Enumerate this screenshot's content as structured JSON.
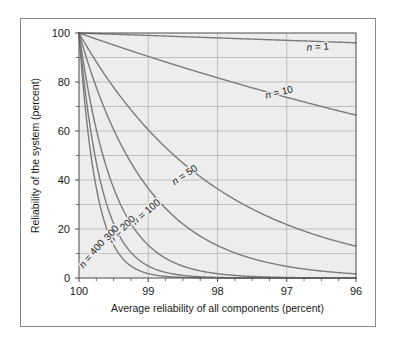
{
  "figure": {
    "background_color": "#ffffff",
    "frame_color": "#8a8a8a",
    "plot_background_color": "#ededed",
    "grid_color": "#b4b4b4",
    "axis_color": "#4a4a4a",
    "curve_color": "#7b7b7b"
  },
  "chart_data": {
    "type": "line",
    "title": "",
    "subtitle": "",
    "xlabel": "Average reliability of all components (percent)",
    "ylabel": "Reliability of the system (percent)",
    "xlim": [
      100,
      96
    ],
    "ylim": [
      0,
      100
    ],
    "x_ticks": [
      100,
      99,
      98,
      97,
      96
    ],
    "x_tick_labels": [
      "100",
      "99",
      "98",
      "97",
      "96"
    ],
    "x_minor_ticks": [
      99.75,
      99.5,
      99.25,
      98.75,
      98.5,
      98.25,
      97.75,
      97.5,
      97.25,
      96.75,
      96.5,
      96.25
    ],
    "y_ticks": [
      0,
      20,
      40,
      60,
      80,
      100
    ],
    "y_tick_labels": [
      "0",
      "20",
      "40",
      "60",
      "80",
      "100"
    ],
    "y_minor_ticks": [
      10,
      30,
      50,
      70,
      90
    ],
    "grid": true,
    "grid_x_values": [
      99,
      98,
      97
    ],
    "grid_y_values": [
      10,
      20,
      30,
      40,
      50,
      60,
      70,
      80,
      90
    ],
    "legend_position": "inline-curve-labels",
    "annotations": [
      "n = 1",
      "n = 10",
      "n = 50",
      "n = 100",
      "n = 200",
      "n = 300",
      "n = 400"
    ],
    "formula": "R = r^n",
    "series": [
      {
        "name": "n = 1",
        "n": 1,
        "label": "n = 1",
        "label_x": 96.55,
        "label_y": 93.0,
        "label_rotation": -3,
        "x": [
          100,
          99.5,
          99,
          98.5,
          98,
          97.5,
          97,
          96.5,
          96
        ],
        "values": [
          100.0,
          99.5,
          99.0,
          98.5,
          98.0,
          97.5,
          97.0,
          96.5,
          96.0
        ]
      },
      {
        "name": "n = 10",
        "n": 10,
        "label": "n = 10",
        "label_x": 97.1,
        "label_y": 74.5,
        "label_rotation": -14,
        "x": [
          100,
          99.5,
          99,
          98.5,
          98,
          97.5,
          97,
          96.5,
          96
        ],
        "values": [
          100.0,
          95.1,
          90.4,
          86.0,
          81.7,
          77.6,
          73.7,
          70.0,
          66.4
        ]
      },
      {
        "name": "n = 50",
        "n": 50,
        "label": "n = 50",
        "label_x": 98.45,
        "label_y": 41.0,
        "label_rotation": -33,
        "x": [
          100,
          99.75,
          99.5,
          99.25,
          99,
          98.5,
          98,
          97.5,
          97,
          96.5,
          96
        ],
        "values": [
          100.0,
          88.2,
          77.8,
          68.6,
          60.5,
          46.9,
          36.4,
          28.2,
          21.8,
          16.7,
          12.9
        ]
      },
      {
        "name": "n = 100",
        "n": 100,
        "label": "n = 100",
        "label_x": 99.0,
        "label_y": 26.0,
        "label_rotation": -40,
        "x": [
          100,
          99.75,
          99.5,
          99.25,
          99,
          98.5,
          98,
          97.5,
          97,
          96.5,
          96
        ],
        "values": [
          100.0,
          77.9,
          60.6,
          47.1,
          36.6,
          22.1,
          13.3,
          7.9,
          4.8,
          2.8,
          1.7
        ]
      },
      {
        "name": "n = 200",
        "n": 200,
        "label": "n = 200",
        "label_x": 99.35,
        "label_y": 19.0,
        "label_rotation": -45,
        "x": [
          100,
          99.75,
          99.5,
          99.25,
          99,
          98.5,
          98,
          97.5,
          97,
          96.5,
          96
        ],
        "values": [
          100.0,
          60.7,
          36.7,
          22.2,
          13.4,
          4.9,
          1.8,
          0.6,
          0.2,
          0.1,
          0.0
        ]
      },
      {
        "name": "n = 300",
        "n": 300,
        "label": "n = 300",
        "label_x": 99.58,
        "label_y": 15.0,
        "label_rotation": -48,
        "x": [
          100,
          99.75,
          99.5,
          99.25,
          99,
          98.5,
          98,
          97.5,
          97,
          96.5,
          96
        ],
        "values": [
          100.0,
          47.3,
          22.2,
          10.5,
          4.9,
          1.1,
          0.2,
          0.05,
          0.0,
          0.0,
          0.0
        ]
      },
      {
        "name": "n = 400",
        "n": 400,
        "label": "n = 400",
        "label_x": 99.78,
        "label_y": 9.0,
        "label_rotation": -50,
        "x": [
          100,
          99.75,
          99.5,
          99.25,
          99,
          98.5,
          98,
          97.5,
          97,
          96.5,
          96
        ],
        "values": [
          100.0,
          36.8,
          13.4,
          4.9,
          1.8,
          0.24,
          0.03,
          0.0,
          0.0,
          0.0,
          0.0
        ]
      }
    ]
  }
}
